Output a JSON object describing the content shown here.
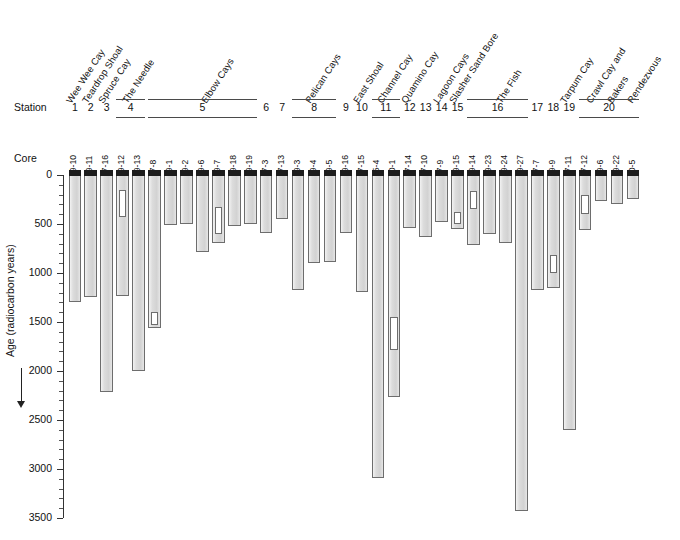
{
  "labels": {
    "station_word": "Station",
    "core_word": "Core",
    "y_axis_title": "Age (radiocarbon years)"
  },
  "axis": {
    "ticks": [
      0,
      500,
      1000,
      1500,
      2000,
      2500,
      3000,
      3500
    ],
    "min": 0,
    "max": 3500,
    "minor_step": 100
  },
  "localities": [
    {
      "name": "Wee Wee Cay",
      "stations": [
        "1"
      ]
    },
    {
      "name": "Teardrop Shoal",
      "stations": [
        "2"
      ]
    },
    {
      "name": "Spruce Cay",
      "stations": [
        "3"
      ]
    },
    {
      "name": "The Needle",
      "stations": [
        "4"
      ]
    },
    {
      "name": "Elbow Cays",
      "stations": [
        "5"
      ]
    },
    {
      "name": "Pelican Cays",
      "stations": [
        "6",
        "7",
        "8",
        "9"
      ]
    },
    {
      "name": "East Shoal",
      "stations": [
        "10"
      ]
    },
    {
      "name": "Channel Cay",
      "stations": [
        "11"
      ]
    },
    {
      "name": "Quamino Cay",
      "stations": [
        "12",
        "13"
      ]
    },
    {
      "name": "Lagoon Cays",
      "stations": [
        "14"
      ]
    },
    {
      "name": "Slasher Sand Bore",
      "stations": [
        "15"
      ]
    },
    {
      "name": "The Fish",
      "stations": [
        "16"
      ]
    },
    {
      "name": "Tarpum Cay",
      "stations": [
        "17",
        "18",
        "19"
      ]
    },
    {
      "name": "Crawl Cay and",
      "stations": []
    },
    {
      "name": "Bakers",
      "stations": []
    },
    {
      "name": "Rendezvous",
      "stations": [
        "20"
      ]
    }
  ],
  "station_numbers": [
    "1",
    "2",
    "3",
    "4",
    "5",
    "6",
    "7",
    "8",
    "9",
    "10",
    "11",
    "12",
    "13",
    "14",
    "15",
    "16",
    "17",
    "18",
    "19",
    "20"
  ],
  "chart_data": {
    "type": "bar",
    "orientation": "vertical-downward",
    "title": "",
    "xlabel": "Core",
    "ylabel": "Age (radiocarbon years)",
    "ylim": [
      0,
      3500
    ],
    "y_inverted": true,
    "grid": false,
    "legend": null,
    "units": "radiocarbon years",
    "categories": [
      "99-10",
      "99-11",
      "97-16",
      "99-12",
      "99-13",
      "97-8",
      "99-1",
      "99-2",
      "99-6",
      "99-7",
      "99-18",
      "99-19",
      "97-3",
      "97-13",
      "99-3",
      "99-4",
      "99-5",
      "99-16",
      "97-15",
      "85-4",
      "00-1",
      "97-14",
      "97-10",
      "97-9",
      "99-15",
      "99-14",
      "99-23",
      "99-24",
      "99-27",
      "97-7",
      "99-9",
      "97-11",
      "97-12",
      "99-6",
      "99-22",
      "00-5"
    ],
    "values": [
      1300,
      1245,
      2215,
      1230,
      2000,
      1560,
      515,
      500,
      790,
      690,
      520,
      505,
      595,
      445,
      1175,
      900,
      885,
      590,
      1190,
      3095,
      2270,
      545,
      630,
      480,
      555,
      715,
      605,
      690,
      3430,
      1175,
      1150,
      2600,
      560,
      270,
      300,
      245
    ],
    "series": [
      {
        "name": "Core age range",
        "cores": [
          {
            "core": "99-10",
            "station": "1",
            "locality": "Wee Wee Cay",
            "top": 0,
            "bottom": 1300,
            "hiatus": null
          },
          {
            "core": "99-11",
            "station": "2",
            "locality": "Teardrop Shoal",
            "top": 0,
            "bottom": 1245,
            "hiatus": null
          },
          {
            "core": "97-16",
            "station": "3",
            "locality": "Spruce Cay",
            "top": 0,
            "bottom": 2215,
            "hiatus": null
          },
          {
            "core": "99-12",
            "station": "4",
            "locality": "The Needle",
            "top": 0,
            "bottom": 1230,
            "hiatus": {
              "from": 150,
              "to": 430
            }
          },
          {
            "core": "99-13",
            "station": "4",
            "locality": "The Needle",
            "top": 0,
            "bottom": 2000,
            "hiatus": null
          },
          {
            "core": "97-8",
            "station": "5",
            "locality": "Elbow Cays",
            "top": 0,
            "bottom": 1560,
            "hiatus": {
              "from": 1400,
              "to": 1530
            }
          },
          {
            "core": "99-1",
            "station": "5",
            "locality": "Elbow Cays",
            "top": 0,
            "bottom": 515,
            "hiatus": null
          },
          {
            "core": "99-2",
            "station": "5",
            "locality": "Elbow Cays",
            "top": 0,
            "bottom": 500,
            "hiatus": null
          },
          {
            "core": "99-6",
            "station": "5",
            "locality": "Elbow Cays",
            "top": 0,
            "bottom": 790,
            "hiatus": null
          },
          {
            "core": "99-7",
            "station": "5",
            "locality": "Elbow Cays",
            "top": 0,
            "bottom": 690,
            "hiatus": {
              "from": 330,
              "to": 600
            }
          },
          {
            "core": "99-18",
            "station": "5",
            "locality": "Elbow Cays",
            "top": 0,
            "bottom": 520,
            "hiatus": null
          },
          {
            "core": "99-19",
            "station": "5",
            "locality": "Elbow Cays",
            "top": 0,
            "bottom": 505,
            "hiatus": null
          },
          {
            "core": "97-3",
            "station": "6",
            "locality": "Pelican Cays",
            "top": 0,
            "bottom": 595,
            "hiatus": null
          },
          {
            "core": "97-13",
            "station": "7",
            "locality": "Pelican Cays",
            "top": 0,
            "bottom": 445,
            "hiatus": null
          },
          {
            "core": "99-3",
            "station": "8",
            "locality": "Pelican Cays",
            "top": 0,
            "bottom": 1175,
            "hiatus": null
          },
          {
            "core": "99-4",
            "station": "8",
            "locality": "Pelican Cays",
            "top": 0,
            "bottom": 900,
            "hiatus": null
          },
          {
            "core": "99-5",
            "station": "8",
            "locality": "Pelican Cays",
            "top": 0,
            "bottom": 885,
            "hiatus": null
          },
          {
            "core": "99-16",
            "station": "9",
            "locality": "Pelican Cays",
            "top": 0,
            "bottom": 590,
            "hiatus": null
          },
          {
            "core": "97-15",
            "station": "10",
            "locality": "East Shoal",
            "top": 0,
            "bottom": 1190,
            "hiatus": null
          },
          {
            "core": "85-4",
            "station": "11",
            "locality": "Channel Cay",
            "top": 0,
            "bottom": 3095,
            "hiatus": null
          },
          {
            "core": "00-1",
            "station": "11",
            "locality": "Channel Cay",
            "top": 0,
            "bottom": 2270,
            "hiatus": {
              "from": 1450,
              "to": 1790
            }
          },
          {
            "core": "97-14",
            "station": "12",
            "locality": "Quamino Cay",
            "top": 0,
            "bottom": 545,
            "hiatus": null
          },
          {
            "core": "97-10",
            "station": "13",
            "locality": "Quamino Cay",
            "top": 0,
            "bottom": 630,
            "hiatus": null
          },
          {
            "core": "97-9",
            "station": "14",
            "locality": "Lagoon Cays",
            "top": 0,
            "bottom": 480,
            "hiatus": null
          },
          {
            "core": "99-15",
            "station": "15",
            "locality": "Slasher Sand Bore",
            "top": 0,
            "bottom": 555,
            "hiatus": {
              "from": 380,
              "to": 500
            }
          },
          {
            "core": "99-14",
            "station": "16",
            "locality": "The Fish",
            "top": 0,
            "bottom": 715,
            "hiatus": {
              "from": 160,
              "to": 350
            }
          },
          {
            "core": "99-23",
            "station": "16",
            "locality": "The Fish",
            "top": 0,
            "bottom": 605,
            "hiatus": null
          },
          {
            "core": "99-24",
            "station": "16",
            "locality": "The Fish",
            "top": 0,
            "bottom": 690,
            "hiatus": null
          },
          {
            "core": "99-27",
            "station": "16",
            "locality": "The Fish",
            "top": 0,
            "bottom": 3430,
            "hiatus": null
          },
          {
            "core": "97-7",
            "station": "17",
            "locality": "Tarpum Cay",
            "top": 0,
            "bottom": 1175,
            "hiatus": null
          },
          {
            "core": "99-9",
            "station": "18",
            "locality": "Tarpum Cay",
            "top": 0,
            "bottom": 1150,
            "hiatus": {
              "from": 820,
              "to": 1000
            }
          },
          {
            "core": "97-11",
            "station": "19",
            "locality": "Tarpum Cay",
            "top": 0,
            "bottom": 2600,
            "hiatus": null
          },
          {
            "core": "97-12",
            "station": "20",
            "locality": "Crawl Cay and Bakers Rendezvous",
            "top": 0,
            "bottom": 560,
            "hiatus": {
              "from": 200,
              "to": 400
            }
          },
          {
            "core": "99-6",
            "station": "20",
            "locality": "Crawl Cay and Bakers Rendezvous",
            "top": 0,
            "bottom": 270,
            "hiatus": null
          },
          {
            "core": "99-22",
            "station": "20",
            "locality": "Crawl Cay and Bakers Rendezvous",
            "top": 0,
            "bottom": 300,
            "hiatus": null
          },
          {
            "core": "00-5",
            "station": "20",
            "locality": "Crawl Cay and Bakers Rendezvous",
            "top": 0,
            "bottom": 245,
            "hiatus": null
          }
        ]
      }
    ]
  }
}
